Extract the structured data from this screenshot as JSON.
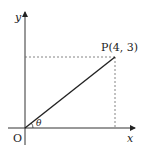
{
  "diagram": {
    "axis_x_label": "x",
    "axis_y_label": "y",
    "origin_label": "O",
    "point_label": "P(4, 3)",
    "angle_label": "θ",
    "point": {
      "x": 4,
      "y": 3
    },
    "colors": {
      "line": "#222222",
      "dashed": "#555555"
    }
  }
}
